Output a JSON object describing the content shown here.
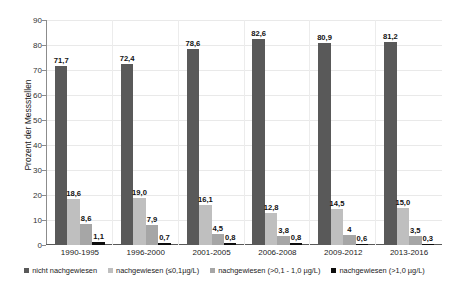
{
  "chart_data": {
    "type": "bar",
    "title": "",
    "subtitle": "",
    "xlabel": "",
    "ylabel": "Prozent der Messstellen",
    "ylim": [
      0,
      90
    ],
    "ytick_step": 10,
    "yticks": [
      "90",
      "80",
      "70",
      "60",
      "50",
      "40",
      "30",
      "20",
      "10",
      "0"
    ],
    "grid": true,
    "grid_axis": "both",
    "legend_position": "bottom",
    "grouping": "grouped",
    "categories": [
      "1990-1995",
      "1996-2000",
      "2001-2005",
      "2006-2008",
      "2009-2012",
      "2013-2016"
    ],
    "series": [
      {
        "name": "nicht nachgewiesen",
        "color": "#595959",
        "values": [
          71.7,
          72.4,
          78.6,
          82.6,
          80.9,
          81.2
        ],
        "labels": [
          "71,7",
          "72,4",
          "78,6",
          "82,6",
          "80,9",
          "81,2"
        ]
      },
      {
        "name": "nachgewiesen (≤0,1µg/L)",
        "color": "#bfbfbf",
        "values": [
          18.6,
          19.0,
          16.1,
          12.8,
          14.5,
          15.0
        ],
        "labels": [
          "18,6",
          "19,0",
          "16,1",
          "12,8",
          "14,5",
          "15,0"
        ]
      },
      {
        "name": "nachgewiesen (>0,1 - 1,0 µg/L)",
        "color": "#a6a6a6",
        "values": [
          8.6,
          7.9,
          4.5,
          3.8,
          4.0,
          3.5
        ],
        "labels": [
          "8,6",
          "7,9",
          "4,5",
          "3,8",
          "4",
          "3,5"
        ]
      },
      {
        "name": "nachgewiesen (>1,0 µg/L)",
        "color": "#0d0d0d",
        "values": [
          1.1,
          0.7,
          0.8,
          0.8,
          0.6,
          0.3
        ],
        "labels": [
          "1,1",
          "0,7",
          "0,8",
          "0,8",
          "0,6",
          "0,3"
        ]
      }
    ]
  }
}
